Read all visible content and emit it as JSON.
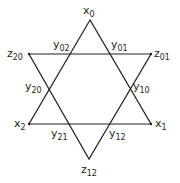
{
  "diagram": {
    "stroke_color": "#231f20",
    "triangles": [
      {
        "name": "upward-triangle",
        "points": [
          [
            90,
            20
          ],
          [
            29,
            124
          ],
          [
            151,
            124
          ]
        ]
      },
      {
        "name": "downward-triangle",
        "points": [
          [
            29,
            54
          ],
          [
            151,
            54
          ],
          [
            89,
            159
          ]
        ]
      }
    ],
    "labels": {
      "x0": {
        "base": "x",
        "sub": "0"
      },
      "x1": {
        "base": "x",
        "sub": "1"
      },
      "x2": {
        "base": "x",
        "sub": "2"
      },
      "z01": {
        "base": "z",
        "sub": "01"
      },
      "z20": {
        "base": "z",
        "sub": "20"
      },
      "z12": {
        "base": "z",
        "sub": "12"
      },
      "y01": {
        "base": "y",
        "sub": "01"
      },
      "y02": {
        "base": "y",
        "sub": "02"
      },
      "y10": {
        "base": "y",
        "sub": "10"
      },
      "y20": {
        "base": "y",
        "sub": "20"
      },
      "y12": {
        "base": "y",
        "sub": "12"
      },
      "y21": {
        "base": "y",
        "sub": "21"
      }
    }
  }
}
